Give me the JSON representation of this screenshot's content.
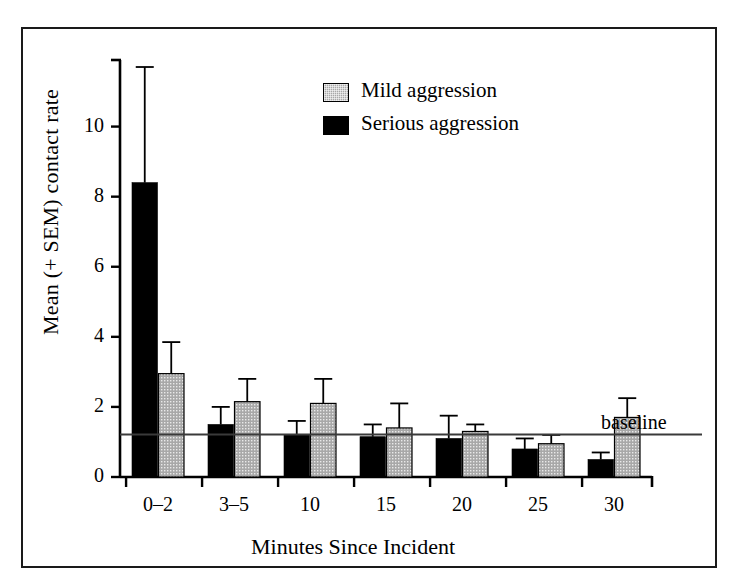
{
  "figure": {
    "background_color": "#ffffff",
    "frame_color": "#1a1a1a"
  },
  "chart_data": {
    "type": "bar",
    "title": "",
    "xlabel": "Minutes Since Incident",
    "ylabel": "Mean (+ SEM) contact rate",
    "categories": [
      "0–2",
      "3–5",
      "10",
      "15",
      "20",
      "25",
      "30"
    ],
    "ylim": [
      0,
      11.9
    ],
    "yticks": [
      0,
      2,
      4,
      6,
      8,
      10
    ],
    "ytick_labels": [
      "0",
      "2",
      "4",
      "6",
      "8",
      "10"
    ],
    "grid": false,
    "legend_position": "upper center",
    "series": [
      {
        "name": "Serious aggression",
        "color": "#000000",
        "fill": "solid",
        "values": [
          8.4,
          1.5,
          1.2,
          1.15,
          1.1,
          0.8,
          0.5
        ],
        "sem": [
          3.3,
          0.5,
          0.4,
          0.35,
          0.65,
          0.3,
          0.2
        ],
        "sem_top": [
          11.7,
          2.0,
          1.6,
          1.5,
          1.75,
          1.1,
          0.7
        ]
      },
      {
        "name": "Mild aggression",
        "color": "#a8a8a8",
        "fill": "stippled",
        "values": [
          2.95,
          2.15,
          2.1,
          1.4,
          1.3,
          0.95,
          1.7
        ],
        "sem": [
          0.9,
          0.65,
          0.7,
          0.7,
          0.2,
          0.25,
          0.55
        ],
        "sem_top": [
          3.85,
          2.8,
          2.8,
          2.1,
          1.5,
          1.2,
          2.25
        ]
      }
    ],
    "annotations": [
      {
        "name": "baseline",
        "label": "baseline",
        "type": "hline",
        "y": 1.21
      }
    ]
  },
  "legend": {
    "items": [
      {
        "label": "Mild aggression",
        "swatch": "mild"
      },
      {
        "label": "Serious aggression",
        "swatch": "serious"
      }
    ]
  }
}
